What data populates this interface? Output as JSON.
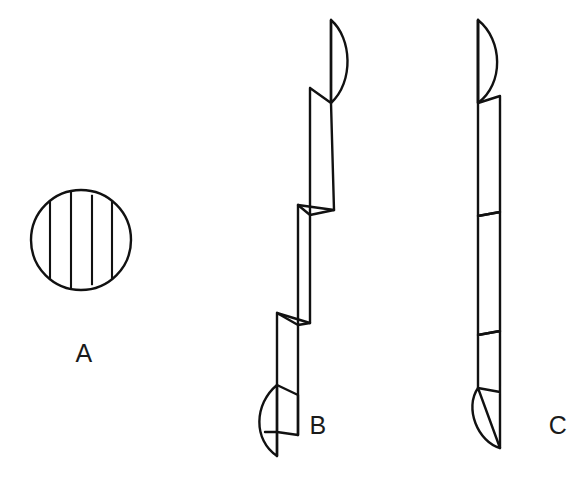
{
  "figure": {
    "background_color": "#ffffff",
    "stroke_color": "#111111",
    "stroke_width": 2.4,
    "canvas": {
      "width": 583,
      "height": 478
    },
    "labels": [
      {
        "id": "label-a",
        "text": "A",
        "x": 84,
        "y": 362,
        "caption": "cross-section view"
      },
      {
        "id": "label-b",
        "text": "B",
        "x": 318,
        "y": 434,
        "caption": "staggered side view"
      },
      {
        "id": "label-c",
        "text": "C",
        "x": 558,
        "y": 434,
        "caption": "aligned side view"
      }
    ],
    "views": {
      "a": {
        "name": "circular cross-section with vertical striations",
        "shape": "circle",
        "center_x": 81,
        "center_y": 240,
        "radius": 50,
        "striation_count": 4,
        "striation_x_offsets": [
          -31,
          -10,
          11,
          31
        ]
      },
      "b": {
        "name": "staggered stacked segments with crescent caps",
        "segment_count": 4,
        "cap_top": "crescent-right",
        "cap_bottom": "crescent-left",
        "offset_direction": "down-left",
        "x_range": [
          265,
          352
        ],
        "y_range": [
          18,
          458
        ]
      },
      "c": {
        "name": "vertically aligned stacked segments with crescent caps",
        "segment_count": 4,
        "cap_top": "crescent-right",
        "cap_bottom": "crescent-left",
        "offset_direction": "none",
        "x_range": [
          472,
          527
        ],
        "y_range": [
          18,
          458
        ]
      }
    }
  }
}
